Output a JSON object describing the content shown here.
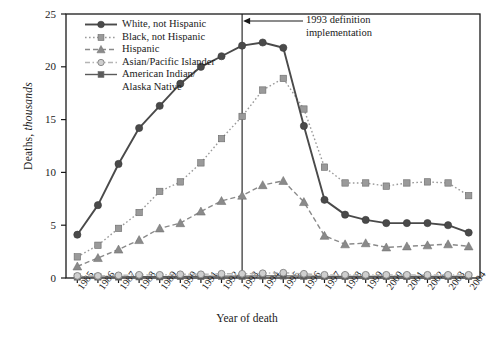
{
  "chart_data": {
    "type": "line",
    "title": "",
    "xlabel": "Year of death",
    "ylabel": "Deaths, thousands",
    "ylabel_plain": "Deaths,",
    "ylabel_italic": "thousands",
    "ylim": [
      0,
      25
    ],
    "yticks": [
      0,
      5,
      10,
      15,
      20,
      25
    ],
    "grid": false,
    "legend_position": "top-left inside",
    "x": [
      1985,
      1986,
      1987,
      1988,
      1989,
      1990,
      1991,
      1992,
      1993,
      1994,
      1995,
      1996,
      1997,
      1998,
      1999,
      2000,
      2001,
      2002,
      2003,
      2004
    ],
    "categories": [
      "1985",
      "1986",
      "1987",
      "1988",
      "1989",
      "1990",
      "1991",
      "1992",
      "1993",
      "1994",
      "1995",
      "1996",
      "1997",
      "1998",
      "1999",
      "2000",
      "2001",
      "2002",
      "2003",
      "2004"
    ],
    "series": [
      {
        "name": "White, not Hispanic",
        "color": "#4a4a4a",
        "marker": "circle",
        "line": "solid",
        "values": [
          4.1,
          6.9,
          10.8,
          14.2,
          16.3,
          18.4,
          20.0,
          21.0,
          22.0,
          22.3,
          21.8,
          14.4,
          7.4,
          6.0,
          5.5,
          5.2,
          5.2,
          5.2,
          5.0,
          4.3
        ]
      },
      {
        "name": "Black, not Hispanic",
        "color": "#9a9a9a",
        "marker": "square",
        "line": "dotted",
        "values": [
          2.0,
          3.1,
          4.7,
          6.2,
          8.2,
          9.1,
          10.9,
          13.2,
          15.3,
          17.8,
          18.9,
          16.0,
          10.5,
          9.0,
          9.0,
          8.7,
          9.0,
          9.1,
          9.0,
          7.8
        ]
      },
      {
        "name": "Hispanic",
        "color": "#8a8a8a",
        "marker": "triangle",
        "line": "dashed",
        "values": [
          1.1,
          1.9,
          2.7,
          3.6,
          4.7,
          5.2,
          6.3,
          7.3,
          7.8,
          8.8,
          9.2,
          7.2,
          4.0,
          3.2,
          3.3,
          2.9,
          3.0,
          3.1,
          3.2,
          3.0
        ]
      },
      {
        "name": "Asian/Pacific Islander",
        "color": "#b5b5b5",
        "marker": "circle-open",
        "line": "dashdot",
        "values": [
          0.2,
          0.2,
          0.25,
          0.3,
          0.3,
          0.35,
          0.35,
          0.4,
          0.4,
          0.45,
          0.5,
          0.4,
          0.3,
          0.3,
          0.3,
          0.3,
          0.3,
          0.3,
          0.3,
          0.3
        ]
      },
      {
        "name": "American Indian/",
        "name_line2": "Alaska Native",
        "color": "#5a5a5a",
        "marker": "square",
        "line": "solid",
        "values": [
          0.1,
          0.1,
          0.1,
          0.12,
          0.12,
          0.15,
          0.15,
          0.18,
          0.18,
          0.2,
          0.2,
          0.18,
          0.15,
          0.15,
          0.15,
          0.15,
          0.15,
          0.15,
          0.15,
          0.15
        ]
      }
    ],
    "annotations": [
      {
        "text_line1": "1993 definition",
        "text_line2": "implementation",
        "points_to_year": 1993,
        "arrow": "left"
      }
    ],
    "reference_lines": [
      {
        "type": "vertical",
        "at_year": 1993
      }
    ]
  }
}
